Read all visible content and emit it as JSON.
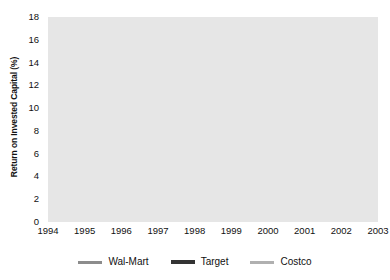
{
  "chart_data": {
    "type": "line",
    "title": "",
    "xlabel": "",
    "ylabel": "Return on Invested Capital (%)",
    "categories": [
      "1994",
      "1995",
      "1996",
      "1997",
      "1998",
      "1999",
      "2000",
      "2001",
      "2002",
      "2003"
    ],
    "x": [
      1994,
      1995,
      1996,
      1997,
      1998,
      1999,
      2000,
      2001,
      2002,
      2003
    ],
    "ylim": [
      0,
      18
    ],
    "ytick_step": 2,
    "yticks": [
      "0",
      "2",
      "4",
      "6",
      "8",
      "10",
      "12",
      "14",
      "16",
      "18"
    ],
    "grid": true,
    "legend_position": "bottom",
    "series": [
      {
        "name": "Wal-Mart",
        "color": "#8c8c8c",
        "width": 2.2,
        "values": [
          8.5,
          9.5,
          9.6,
          10.8,
          12.0,
          13.1,
          12.9,
          10.7,
          10.2,
          9.7
        ]
      },
      {
        "name": "Target",
        "color": "#333333",
        "width": 2.6,
        "values": [
          8.2,
          6.4,
          9.3,
          10.1,
          11.7,
          13.2,
          12.5,
          10.6,
          10.2,
          10.1
        ]
      },
      {
        "name": "Costco",
        "color": "#a6a6a6",
        "width": 2.2,
        "values": [
          13.5,
          12.4,
          12.8,
          13.9,
          15.8,
          14.7,
          14.4,
          13.8,
          14.4,
          14.8
        ]
      }
    ]
  },
  "legend": {
    "items": [
      {
        "label": "Wal-Mart",
        "color": "#8c8c8c",
        "width": 3
      },
      {
        "label": "Target",
        "color": "#333333",
        "width": 4
      },
      {
        "label": "Costco",
        "color": "#b0b0b0",
        "width": 3
      }
    ]
  },
  "style": {
    "plot_background": "#e6e6e6",
    "gridline_color": "#9a9a9a",
    "axis_color": "#666666",
    "text_color": "#111111"
  }
}
